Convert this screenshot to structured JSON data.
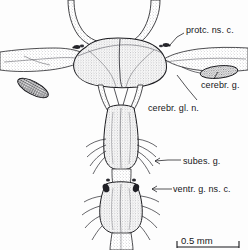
{
  "figure": {
    "background_color": "#fdfdfd",
    "ink_color": "#1b1b1f",
    "stipple_color": "#6d6d72",
    "dark_fill_color": "#26262a"
  },
  "labels": [
    {
      "id": "protocerebral-neurosecretory-cells",
      "text": "protc. ns. c.",
      "x": 186,
      "y": 26,
      "leader": {
        "from_x": 184,
        "from_y": 33,
        "to_x": 170,
        "to_y": 45,
        "bend_x": 177,
        "bend_y": 37
      }
    },
    {
      "id": "cerebral-gland",
      "text": "cerebr. g.",
      "x": 201,
      "y": 81,
      "leader": {
        "from_x": 214,
        "from_y": 79,
        "to_x": 218,
        "to_y": 72,
        "bend_x": 216,
        "bend_y": 75
      }
    },
    {
      "id": "cerebral-gland-nerve",
      "text": "cerebr. gl. n.",
      "x": 148,
      "y": 104,
      "leader": {
        "from_x": 197,
        "from_y": 100,
        "to_x": 177,
        "to_y": 75,
        "bend_x": 187,
        "bend_y": 88
      }
    },
    {
      "id": "subesophageal-ganglion",
      "text": "subes. g.",
      "x": 183,
      "y": 157,
      "leader": {
        "from_x": 181,
        "from_y": 160,
        "to_x": 155,
        "to_y": 161,
        "bend_x": 168,
        "bend_y": 160
      }
    },
    {
      "id": "ventral-ganglion-neurosecretory-cells",
      "text": "ventr. g. ns. c.",
      "x": 173,
      "y": 185,
      "leader": {
        "from_x": 172,
        "from_y": 189,
        "to_x": 152,
        "to_y": 189,
        "bend_x": 162,
        "bend_y": 189
      }
    }
  ],
  "scale_bar": {
    "label": "0.5 mm",
    "x": 181,
    "y": 236,
    "bar_x1": 177,
    "bar_x2": 239,
    "bar_y": 247,
    "tick_height": 7
  },
  "structures": {
    "brain_lobes": "paired protocerebral lobes, stippled",
    "left_gland": "dark densely stippled elongate oval",
    "right_gland": "lighter stippled elongate oval",
    "circumesophageal_connectives": "paired descending connectives",
    "subesophageal_ganglion": "median elongate ganglion with lateral nerves",
    "ventral_ganglion": "posterior ganglion with paired lateral nerves and dark neurosecretory patches"
  }
}
